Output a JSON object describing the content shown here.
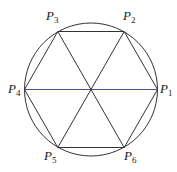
{
  "diagram": {
    "circle": {
      "cx": 91,
      "cy": 89.5,
      "r": 66.5,
      "stroke": "#333333"
    },
    "center": {
      "x": 91,
      "y": 89.5
    },
    "vertices": [
      {
        "id": "P1",
        "letter": "P",
        "sub": "1",
        "x": 157.5,
        "y": 89.5,
        "lx": 160,
        "ly": 93
      },
      {
        "id": "P2",
        "letter": "P",
        "sub": "2",
        "x": 124.2,
        "y": 31.5,
        "lx": 123,
        "ly": 20
      },
      {
        "id": "P3",
        "letter": "P",
        "sub": "3",
        "x": 57.8,
        "y": 31.5,
        "lx": 46,
        "ly": 20
      },
      {
        "id": "P4",
        "letter": "P",
        "sub": "4",
        "x": 24.5,
        "y": 89.5,
        "lx": 8,
        "ly": 93
      },
      {
        "id": "P5",
        "letter": "P",
        "sub": "5",
        "x": 57.8,
        "y": 147.5,
        "lx": 44,
        "ly": 160
      },
      {
        "id": "P6",
        "letter": "P",
        "sub": "6",
        "x": 124.2,
        "y": 147.5,
        "lx": 124,
        "ly": 160
      }
    ],
    "edges_color": "#333333",
    "diameter_P4_P1_color": "#4a4f8a"
  }
}
